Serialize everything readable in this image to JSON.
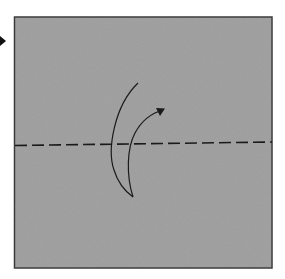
{
  "diagram": {
    "type": "origami-step",
    "colors": {
      "background": "#ffffff",
      "paper": "#9b9b9b",
      "paper_border": "#3a3a3a",
      "lines": "#1a1a1a"
    },
    "paper_square": {
      "x": 14,
      "y": 17,
      "width": 258,
      "height": 251
    },
    "fold_line": {
      "style": "dashed",
      "kind": "valley-fold",
      "x1": 15,
      "y1": 145.5,
      "x2": 272,
      "y2": 142
    },
    "fold_arrow": {
      "kind": "curved-fold-arrow",
      "direction": "bottom-to-top",
      "start": [
        138,
        83
      ],
      "turn": [
        133,
        197
      ],
      "tip": [
        165,
        109
      ]
    },
    "step_marker": {
      "kind": "step-arrowhead",
      "x": 3,
      "y": 41
    }
  }
}
